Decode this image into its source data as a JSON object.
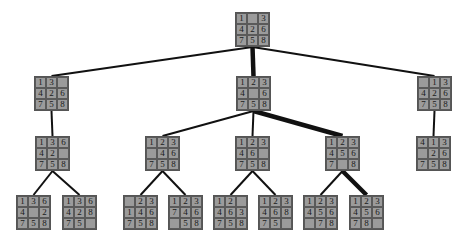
{
  "diagram": {
    "type": "8-puzzle search tree",
    "nodes": [
      {
        "id": "root",
        "x": 235,
        "y": 12,
        "tiles": [
          "1",
          "",
          "3",
          "4",
          "2",
          "6",
          "7",
          "5",
          "8"
        ]
      },
      {
        "id": "l1a",
        "x": 34,
        "y": 76,
        "tiles": [
          "1",
          "3",
          "",
          "4",
          "2",
          "6",
          "7",
          "5",
          "8"
        ]
      },
      {
        "id": "l1b",
        "x": 236,
        "y": 76,
        "tiles": [
          "1",
          "2",
          "3",
          "4",
          "",
          "6",
          "7",
          "5",
          "8"
        ]
      },
      {
        "id": "l1c",
        "x": 417,
        "y": 76,
        "tiles": [
          "",
          "1",
          "3",
          "4",
          "2",
          "6",
          "7",
          "5",
          "8"
        ]
      },
      {
        "id": "l2a",
        "x": 35,
        "y": 136,
        "tiles": [
          "1",
          "3",
          "6",
          "4",
          "2",
          "",
          "7",
          "5",
          "8"
        ]
      },
      {
        "id": "l2b",
        "x": 145,
        "y": 136,
        "tiles": [
          "1",
          "2",
          "3",
          "",
          "4",
          "6",
          "7",
          "5",
          "8"
        ]
      },
      {
        "id": "l2c",
        "x": 235,
        "y": 136,
        "tiles": [
          "1",
          "2",
          "3",
          "4",
          "6",
          "",
          "7",
          "5",
          "8"
        ]
      },
      {
        "id": "l2d",
        "x": 325,
        "y": 136,
        "tiles": [
          "1",
          "2",
          "3",
          "4",
          "5",
          "6",
          "7",
          "",
          "8"
        ]
      },
      {
        "id": "l2e",
        "x": 416,
        "y": 136,
        "tiles": [
          "4",
          "1",
          "3",
          "",
          "2",
          "6",
          "7",
          "5",
          "8"
        ]
      },
      {
        "id": "l3a",
        "x": 16,
        "y": 195,
        "tiles": [
          "1",
          "3",
          "6",
          "4",
          "",
          "2",
          "7",
          "5",
          "8"
        ]
      },
      {
        "id": "l3b",
        "x": 62,
        "y": 195,
        "tiles": [
          "1",
          "3",
          "6",
          "4",
          "2",
          "8",
          "7",
          "5",
          ""
        ]
      },
      {
        "id": "l3c",
        "x": 123,
        "y": 195,
        "tiles": [
          "",
          "2",
          "3",
          "1",
          "4",
          "6",
          "7",
          "5",
          "8"
        ]
      },
      {
        "id": "l3d",
        "x": 168,
        "y": 195,
        "tiles": [
          "1",
          "2",
          "3",
          "7",
          "4",
          "6",
          "",
          "5",
          "8"
        ]
      },
      {
        "id": "l3e",
        "x": 213,
        "y": 195,
        "tiles": [
          "1",
          "2",
          "",
          "4",
          "6",
          "3",
          "7",
          "5",
          "8"
        ]
      },
      {
        "id": "l3f",
        "x": 258,
        "y": 195,
        "tiles": [
          "1",
          "2",
          "3",
          "4",
          "6",
          "8",
          "7",
          "5",
          ""
        ]
      },
      {
        "id": "l3g",
        "x": 303,
        "y": 195,
        "tiles": [
          "1",
          "2",
          "3",
          "4",
          "5",
          "6",
          "",
          "7",
          "8"
        ]
      },
      {
        "id": "l3h",
        "x": 349,
        "y": 195,
        "tiles": [
          "1",
          "2",
          "3",
          "4",
          "5",
          "6",
          "7",
          "8",
          ""
        ]
      }
    ],
    "edges": [
      {
        "from": "root",
        "to": "l1a",
        "solution_path": false
      },
      {
        "from": "root",
        "to": "l1b",
        "solution_path": true
      },
      {
        "from": "root",
        "to": "l1c",
        "solution_path": false
      },
      {
        "from": "l1a",
        "to": "l2a",
        "solution_path": false
      },
      {
        "from": "l1b",
        "to": "l2b",
        "solution_path": false
      },
      {
        "from": "l1b",
        "to": "l2c",
        "solution_path": false
      },
      {
        "from": "l1b",
        "to": "l2d",
        "solution_path": true
      },
      {
        "from": "l1c",
        "to": "l2e",
        "solution_path": false
      },
      {
        "from": "l2a",
        "to": "l3a",
        "solution_path": false
      },
      {
        "from": "l2a",
        "to": "l3b",
        "solution_path": false
      },
      {
        "from": "l2b",
        "to": "l3c",
        "solution_path": false
      },
      {
        "from": "l2b",
        "to": "l3d",
        "solution_path": false
      },
      {
        "from": "l2c",
        "to": "l3e",
        "solution_path": false
      },
      {
        "from": "l2c",
        "to": "l3f",
        "solution_path": false
      },
      {
        "from": "l2d",
        "to": "l3g",
        "solution_path": false
      },
      {
        "from": "l2d",
        "to": "l3h",
        "solution_path": true
      }
    ],
    "colors": {
      "tile": "#9b9b9b",
      "edge": "#111111",
      "text": "#1a1a1a"
    }
  }
}
